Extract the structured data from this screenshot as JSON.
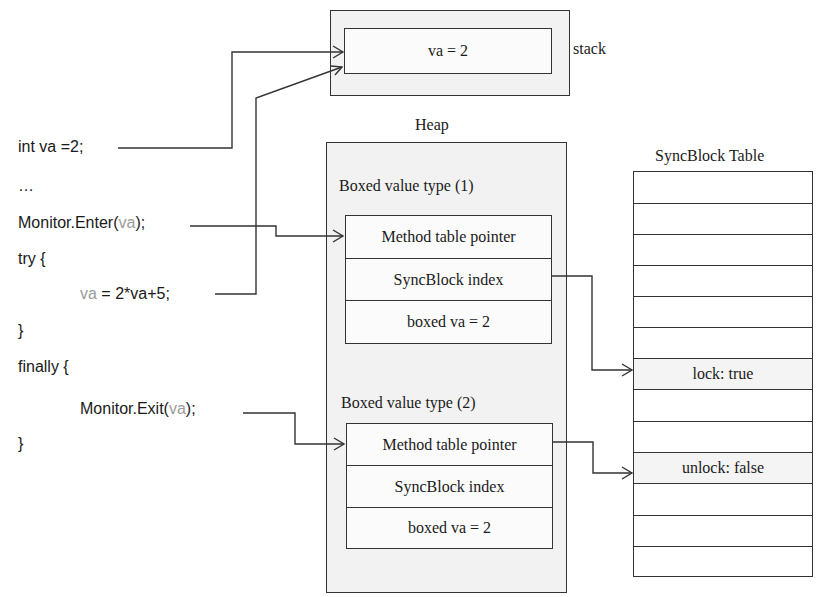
{
  "code": {
    "lines": [
      {
        "id": "decl",
        "parts": [
          {
            "text": "int va =2;",
            "grey": false
          }
        ]
      },
      {
        "id": "ellipsis",
        "parts": [
          {
            "text": "…",
            "grey": false
          }
        ]
      },
      {
        "id": "enter",
        "parts": [
          {
            "text": "Monitor.Enter(",
            "grey": false
          },
          {
            "text": "va",
            "grey": true
          },
          {
            "text": ");",
            "grey": false
          }
        ]
      },
      {
        "id": "try",
        "parts": [
          {
            "text": "try {",
            "grey": false
          }
        ]
      },
      {
        "id": "assign",
        "parts": [
          {
            "text": "va",
            "grey": true
          },
          {
            "text": " = 2*va+5;",
            "grey": false
          }
        ]
      },
      {
        "id": "close1",
        "parts": [
          {
            "text": "}",
            "grey": false
          }
        ]
      },
      {
        "id": "finally",
        "parts": [
          {
            "text": "finally {",
            "grey": false
          }
        ]
      },
      {
        "id": "exit",
        "parts": [
          {
            "text": "Monitor.Exit(",
            "grey": false
          },
          {
            "text": "va",
            "grey": true
          },
          {
            "text": ");",
            "grey": false
          }
        ]
      },
      {
        "id": "close2",
        "parts": [
          {
            "text": "}",
            "grey": false
          }
        ]
      }
    ]
  },
  "stack": {
    "label": "stack",
    "value": "va = 2"
  },
  "heap": {
    "label": "Heap",
    "boxed1": {
      "title": "Boxed value type (1)",
      "fields": [
        "Method table pointer",
        "SyncBlock index",
        "boxed va = 2"
      ]
    },
    "boxed2": {
      "title": "Boxed value type (2)",
      "fields": [
        "Method table pointer",
        "SyncBlock index",
        "boxed  va = 2"
      ]
    }
  },
  "syncblock_table": {
    "title": "SyncBlock Table",
    "rows": [
      "",
      "",
      "",
      "",
      "",
      "",
      "lock: true",
      "",
      "",
      "unlock: false",
      "",
      "",
      ""
    ]
  },
  "colors": {
    "line": "#333333",
    "region_fill": "#f2f2f2",
    "grey_text": "#9a9a9a"
  }
}
